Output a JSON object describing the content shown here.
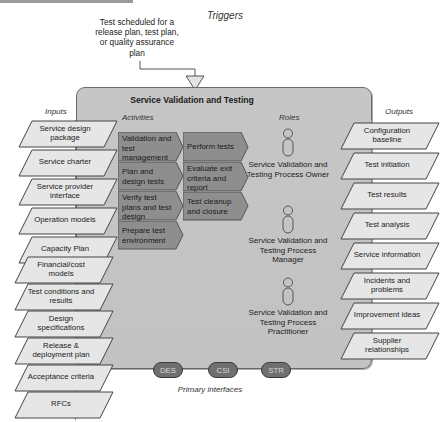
{
  "diagram": {
    "title": "Service Validation and Testing",
    "triggers_label": "Triggers",
    "trigger_text": "Test scheduled for a release plan, test plan, or quality assurance plan",
    "inputs_label": "Inputs",
    "outputs_label": "Outputs",
    "activities_label": "Activities",
    "roles_label": "Roles",
    "primary_interfaces_label": "Primary interfaces"
  },
  "inputs": [
    {
      "label": "Service design package"
    },
    {
      "label": "Service charter"
    },
    {
      "label": "Service provider interface"
    },
    {
      "label": "Operation models"
    },
    {
      "label": "Capacity Plan"
    },
    {
      "label": "Financial/cost models"
    },
    {
      "label": "Test conditions and results"
    },
    {
      "label": "Design specifications"
    },
    {
      "label": "Release & deployment plan"
    },
    {
      "label": "Acceptance criteria"
    },
    {
      "label": "RFCs"
    }
  ],
  "activities_col1": [
    {
      "label": "Validation and test management"
    },
    {
      "label": "Plan and design tests"
    },
    {
      "label": "Verify test plans and test design"
    },
    {
      "label": "Prepare test environment"
    }
  ],
  "activities_col2": [
    {
      "label": "Perform tests"
    },
    {
      "label": "Evaluate exit criteria and report"
    },
    {
      "label": "Test cleanup and closure"
    }
  ],
  "roles": [
    {
      "label": "Service Validation and Testing Process Owner"
    },
    {
      "label": "Service Validation and Testing Process Manager"
    },
    {
      "label": "Service Validation and Testing Process Practitioner"
    }
  ],
  "outputs": [
    {
      "label": "Configuration baseline"
    },
    {
      "label": "Test initiation"
    },
    {
      "label": "Test results"
    },
    {
      "label": "Test analysis"
    },
    {
      "label": "Service information"
    },
    {
      "label": "Incidents and problems"
    },
    {
      "label": "Improvement ideas"
    },
    {
      "label": "Supplier relationships"
    }
  ],
  "interfaces": [
    {
      "label": "DES"
    },
    {
      "label": "CSI"
    },
    {
      "label": "STR"
    }
  ],
  "colors": {
    "main_box": "#c4c4c4",
    "activity": "#8e8e8e",
    "parallelogram": "#e6e6e6",
    "interface_pill": "#6f6f6f"
  }
}
